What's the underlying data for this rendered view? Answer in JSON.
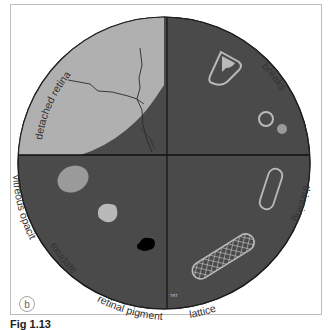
{
  "figure": {
    "panel_letter": "b",
    "caption": "Fig 1.13",
    "corner_tag": "TRT"
  },
  "labels": {
    "detached_retina": "detached retina",
    "breaks": "breaks",
    "thinning": "thinning",
    "lattice": "lattice",
    "retinal_pigment": "retinal pigment",
    "exudate": "exudate",
    "vitreous_opacity": "vitreous opacity"
  },
  "colors": {
    "fundus": "#4a4a4a",
    "detached_retina": "#b0b0b0",
    "lesion_light": "#b9b9b9",
    "lesion_mid": "#9a9a9a",
    "pigment": "#000000",
    "outline": "#1e1e1e"
  }
}
